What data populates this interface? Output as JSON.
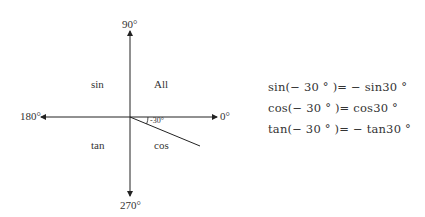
{
  "diagram": {
    "axes": {
      "top": "90°",
      "left": "180°",
      "right": "0°",
      "bottom": "270°"
    },
    "quadrants": {
      "q1": "All",
      "q2": "sin",
      "q3": "tan",
      "q4": "cos"
    },
    "angle_label": "-30°",
    "equations": [
      "sin(− 30 ° )= − sin30 °",
      "cos(− 30 ° )= cos30 °",
      "tan(− 30 ° )= − tan30 °"
    ]
  }
}
